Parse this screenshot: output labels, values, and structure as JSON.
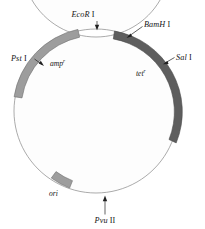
{
  "figure": {
    "kind": "plasmid-map"
  },
  "ring": {
    "center_x": 96,
    "center_y": 111,
    "outer_radius": 82,
    "inner_radius": 74,
    "backbone_color": "#fdfdfd",
    "outline_color": "#8a8a8a"
  },
  "segments": [
    {
      "name": "amp-segment",
      "gene": "amp",
      "superscript": "r",
      "color": "#9d9d9d",
      "start_angle": 190,
      "end_angle": 284,
      "label_x": 50,
      "label_y": 66
    },
    {
      "name": "tet-segment",
      "gene": "tet",
      "superscript": "r",
      "color": "#5e5e5e",
      "start_angle": 290,
      "end_angle": 10,
      "label_x": 136,
      "label_y": 76
    },
    {
      "name": "ori-segment",
      "gene": "ori",
      "superscript": "",
      "color": "#9d9d9d",
      "start_angle": 117,
      "end_angle": 130,
      "label_x": 49,
      "label_y": 196
    }
  ],
  "sites": [
    {
      "name": "ecor1-site",
      "enzyme": "EcoR",
      "numeral": "I",
      "label_x": 83,
      "label_y": 17,
      "pointer": "arrow-down"
    },
    {
      "name": "bamh1-site",
      "enzyme": "BamH",
      "numeral": "I",
      "label_x": 144,
      "label_y": 27,
      "pointer": "leader-down-left"
    },
    {
      "name": "sal1-site",
      "enzyme": "Sal",
      "numeral": "I",
      "label_x": 176,
      "label_y": 60,
      "pointer": "leader-left"
    },
    {
      "name": "pst1-site",
      "enzyme": "Pst",
      "numeral": "I",
      "label_x": 11,
      "label_y": 61,
      "pointer": "leader-right"
    },
    {
      "name": "pvu2-site",
      "enzyme": "Pvu",
      "numeral": "II",
      "label_x": 87,
      "label_y": 223,
      "pointer": "arrow-up"
    }
  ]
}
